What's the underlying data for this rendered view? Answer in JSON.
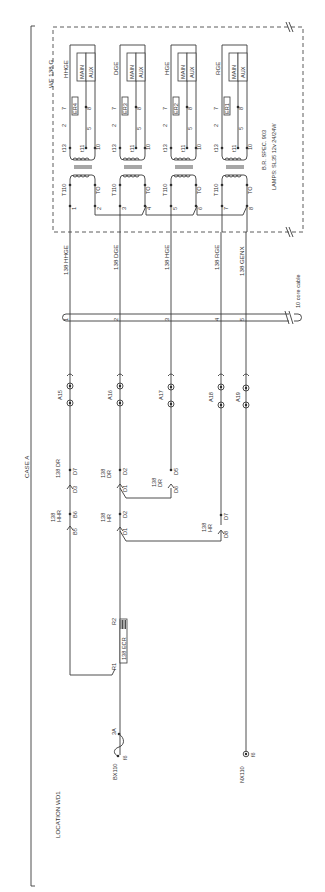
{
  "diagram": {
    "title": "CASE A",
    "location": "LOCATION WD1",
    "relay_panel": {
      "label": "WF 138 G",
      "spec": "B.R. SPEC. 903",
      "lamps": "LAMPS: SL35 12v 24/24W",
      "transformer_primary_label": "T110",
      "transformer_primary_return": "TO",
      "secondary_terminals": [
        "t13",
        "t11",
        "10"
      ],
      "pin_labels": [
        "2",
        "7",
        "5",
        "8"
      ],
      "groups": [
        {
          "aspect": "HHGE",
          "relay": "ER4",
          "main": "MAIN",
          "aux": "AUX",
          "in_terminal": "1",
          "out_terminal": "2"
        },
        {
          "aspect": "DGE",
          "relay": "ER3",
          "main": "MAIN",
          "aux": "AUX",
          "in_terminal": "3",
          "out_terminal": "4"
        },
        {
          "aspect": "HGE",
          "relay": "ER2",
          "main": "MAIN",
          "aux": "AUX",
          "in_terminal": "5",
          "out_terminal": "6"
        },
        {
          "aspect": "RGE",
          "relay": "ER1",
          "main": "MAIN",
          "aux": "AUX",
          "in_terminal": "7",
          "out_terminal": "8"
        }
      ]
    },
    "wires": [
      {
        "label": "138 HHGE",
        "core": "1",
        "terminal": "A15"
      },
      {
        "label": "138 DGE",
        "core": "2",
        "terminal": "A16"
      },
      {
        "label": "138 HGE",
        "core": "3",
        "terminal": "A17"
      },
      {
        "label": "138 RGE",
        "core": "4",
        "terminal": "A18"
      },
      {
        "label": "138 GENX",
        "core": "5",
        "terminal": "A19"
      }
    ],
    "cable": {
      "label": "10 core cable"
    },
    "contacts": [
      {
        "relay": "138 DR",
        "front": "D7",
        "back": "D3"
      },
      {
        "relay": "138 HHR",
        "front": "B6",
        "back": "B5"
      },
      {
        "relay": "138 DR",
        "front": "D2",
        "back": "D1"
      },
      {
        "relay": "138 HR",
        "front": "D2",
        "back": "D1"
      },
      {
        "relay": "138 DR",
        "front": "D5",
        "back": "D6"
      },
      {
        "relay": "138 HR",
        "front": "D7",
        "back": "D8"
      }
    ],
    "ecr": {
      "label": "138 ECR",
      "r1": "R1",
      "r2": "R2"
    },
    "supply": {
      "fuse_label": "BX110",
      "fuse_rating": "3A",
      "fuse_terminal": "f6",
      "neutral_label": "NX110",
      "neutral_terminal": "f6"
    }
  }
}
